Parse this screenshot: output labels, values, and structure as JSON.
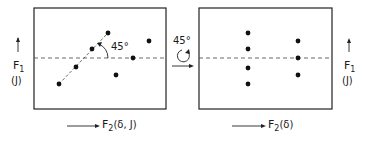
{
  "diagram": {
    "left_panel": {
      "y_axis_label": "F",
      "y_axis_sub": "1",
      "y_axis_unit": "(J)",
      "x_axis_label": "F",
      "x_axis_sub": "2",
      "x_axis_unit": "(δ, J)",
      "angle_label": "45°",
      "points": [
        [
          59,
          84
        ],
        [
          76,
          67
        ],
        [
          92,
          49
        ],
        [
          108,
          33
        ],
        [
          133,
          58
        ],
        [
          149,
          41
        ],
        [
          116,
          75
        ]
      ]
    },
    "transform": {
      "angle_label": "45°",
      "icon": "rotate-clockwise-icon"
    },
    "right_panel": {
      "y_axis_label": "F",
      "y_axis_sub": "1",
      "y_axis_unit": "(J)",
      "x_axis_label": "F",
      "x_axis_sub": "2",
      "x_axis_unit": "(δ)",
      "points": [
        [
          248,
          33
        ],
        [
          248,
          49
        ],
        [
          248,
          68
        ],
        [
          248,
          84
        ],
        [
          298,
          41
        ],
        [
          298,
          58
        ],
        [
          298,
          75
        ]
      ]
    }
  }
}
